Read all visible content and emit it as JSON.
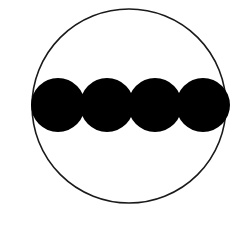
{
  "diagram": {
    "outer_circle": {
      "cx": 129,
      "cy": 106,
      "r": 97,
      "stroke": "#1a1a1a",
      "fill": "#ffffff"
    },
    "inner_circles": [
      {
        "cx": 58,
        "cy": 105,
        "r": 27,
        "fill": "#000000"
      },
      {
        "cx": 107,
        "cy": 105,
        "r": 27,
        "fill": "#000000"
      },
      {
        "cx": 155,
        "cy": 105,
        "r": 27,
        "fill": "#000000"
      },
      {
        "cx": 203,
        "cy": 105,
        "r": 27,
        "fill": "#000000"
      }
    ],
    "count": 4
  }
}
